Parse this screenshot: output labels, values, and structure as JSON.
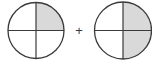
{
  "diagram": {
    "operator": "+",
    "colors": {
      "stroke": "#3a3a3a",
      "shade": "#d9d9d9",
      "background": "#ffffff"
    },
    "left_circle": {
      "parts": 4,
      "shaded_quadrants": [
        "top-right"
      ],
      "shaded_count": 1
    },
    "right_circle": {
      "parts": 4,
      "shaded_quadrants": [
        "top-right",
        "bottom-right"
      ],
      "shaded_count": 2
    }
  }
}
